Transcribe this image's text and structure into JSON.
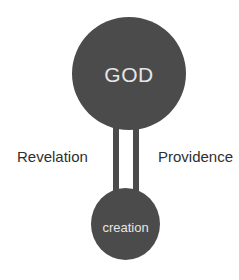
{
  "diagram": {
    "nodes": [
      {
        "id": "god",
        "label": "GOD"
      },
      {
        "id": "creation",
        "label": "creation"
      }
    ],
    "connectors": [
      {
        "from": "god",
        "to": "creation",
        "label": "Revelation",
        "side": "left"
      },
      {
        "from": "god",
        "to": "creation",
        "label": "Providence",
        "side": "right"
      }
    ],
    "colors": {
      "node_fill": "#4b4b4b",
      "node_text": "#e6e6e6",
      "label_text": "#2f2f2f",
      "background": "#ffffff"
    }
  }
}
